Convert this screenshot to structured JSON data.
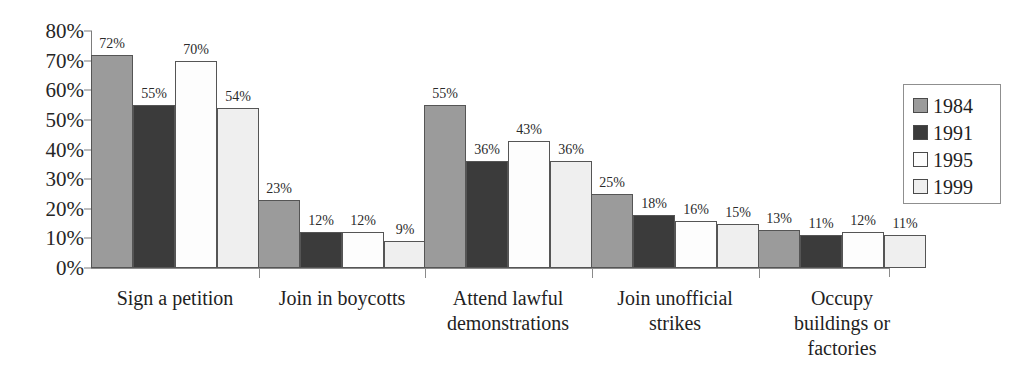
{
  "chart_data": {
    "type": "bar",
    "title": "",
    "xlabel": "",
    "ylabel": "",
    "ylim": [
      0,
      80
    ],
    "grid": false,
    "legend_position": "right",
    "y_ticks": [
      "0%",
      "10%",
      "20%",
      "30%",
      "40%",
      "50%",
      "60%",
      "70%",
      "80%"
    ],
    "y_tick_values": [
      0,
      10,
      20,
      30,
      40,
      50,
      60,
      70,
      80
    ],
    "categories": [
      "Sign a petition",
      "Join in boycotts",
      "Attend lawful demonstrations",
      "Join unofficial strikes",
      "Occupy buildings or factories"
    ],
    "category_lines": [
      [
        "Sign a petition"
      ],
      [
        "Join in boycotts"
      ],
      [
        "Attend lawful",
        "demonstrations"
      ],
      [
        "Join unofficial",
        "strikes"
      ],
      [
        "Occupy",
        "buildings or",
        "factories"
      ]
    ],
    "series": [
      {
        "name": "1984",
        "color": "#9b9b9b",
        "values": [
          72,
          23,
          55,
          25,
          13
        ],
        "labels": [
          "72%",
          "23%",
          "55%",
          "25%",
          "13%"
        ]
      },
      {
        "name": "1991",
        "color": "#3b3b3b",
        "values": [
          55,
          12,
          36,
          18,
          11
        ],
        "labels": [
          "55%",
          "12%",
          "36%",
          "18%",
          "11%"
        ]
      },
      {
        "name": "1995",
        "color": "#fdfdfd",
        "values": [
          70,
          12,
          43,
          16,
          12
        ],
        "labels": [
          "70%",
          "12%",
          "43%",
          "16%",
          "12%"
        ]
      },
      {
        "name": "1999",
        "color": "#efefef",
        "values": [
          54,
          9,
          36,
          15,
          11
        ],
        "labels": [
          "54%",
          "9%",
          "36%",
          "15%",
          "11%"
        ]
      }
    ]
  },
  "legend": {
    "items": [
      {
        "label": "1984",
        "color": "#9b9b9b"
      },
      {
        "label": "1991",
        "color": "#3b3b3b"
      },
      {
        "label": "1995",
        "color": "#fdfdfd"
      },
      {
        "label": "1999",
        "color": "#efefef"
      }
    ]
  }
}
